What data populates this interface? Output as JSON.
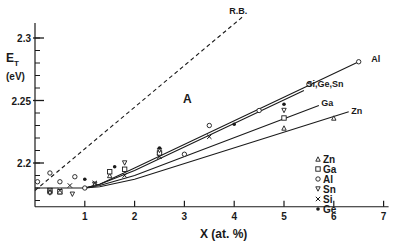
{
  "chart_data": {
    "type": "line",
    "title": "",
    "xlabel": "X (at. %)",
    "ylabel_main": "E",
    "ylabel_sub": "T",
    "ylabel_unit": "(eV)",
    "xlim": [
      0,
      7.1
    ],
    "ylim": [
      2.165,
      2.32
    ],
    "x_ticks": [
      1,
      2,
      3,
      4,
      5,
      6,
      7
    ],
    "y_ticks": [
      {
        "value": 2.2,
        "label": "2.2"
      },
      {
        "value": 2.25,
        "label": "2.25"
      },
      {
        "value": 2.3,
        "label": "2.3"
      }
    ],
    "y_minor_step": 0.01,
    "region_label": "A",
    "series": [
      {
        "name": "R.B.",
        "style": "dashed",
        "points": [
          [
            0,
            2.178
          ],
          [
            4.2,
            2.318
          ]
        ],
        "label": "R.B.",
        "label_pos": [
          3.9,
          2.322
        ]
      },
      {
        "name": "Al",
        "style": "solid",
        "points": [
          [
            0,
            2.18
          ],
          [
            1.0,
            2.18
          ],
          [
            1.3,
            2.183
          ],
          [
            2.0,
            2.196
          ],
          [
            6.5,
            2.281
          ]
        ],
        "label": "Al",
        "label_pos": [
          6.75,
          2.283
        ]
      },
      {
        "name": "Si,Ge,Sn",
        "style": "solid",
        "points": [
          [
            1.0,
            2.18
          ],
          [
            1.3,
            2.183
          ],
          [
            2.0,
            2.194
          ],
          [
            5.4,
            2.258
          ]
        ],
        "label": "Si,Ge,Sn",
        "label_pos": [
          5.45,
          2.263
        ]
      },
      {
        "name": "Ga",
        "style": "solid",
        "points": [
          [
            1.0,
            2.18
          ],
          [
            1.3,
            2.182
          ],
          [
            2.0,
            2.19
          ],
          [
            5.7,
            2.246
          ]
        ],
        "label": "Ga",
        "label_pos": [
          5.75,
          2.248
        ]
      },
      {
        "name": "Zn",
        "style": "solid",
        "points": [
          [
            1.0,
            2.18
          ],
          [
            1.3,
            2.181
          ],
          [
            2.0,
            2.187
          ],
          [
            6.3,
            2.241
          ]
        ],
        "label": "Zn",
        "label_pos": [
          6.35,
          2.242
        ]
      }
    ],
    "markers": [
      {
        "element": "Al",
        "symbol": "circle",
        "points": [
          [
            0.05,
            2.185
          ],
          [
            0.3,
            2.192
          ],
          [
            0.5,
            2.185
          ],
          [
            0.8,
            2.189
          ],
          [
            1.0,
            2.18
          ],
          [
            3.0,
            2.207
          ],
          [
            3.5,
            2.23
          ],
          [
            4.5,
            2.242
          ],
          [
            5.5,
            2.263
          ],
          [
            6.5,
            2.281
          ]
        ]
      },
      {
        "element": "Zn",
        "symbol": "triangle",
        "points": [
          [
            0.3,
            2.177
          ],
          [
            0.5,
            2.177
          ],
          [
            1.5,
            2.19
          ],
          [
            2.5,
            2.21
          ],
          [
            5.0,
            2.228
          ],
          [
            6.0,
            2.236
          ]
        ]
      },
      {
        "element": "Ga",
        "symbol": "square",
        "points": [
          [
            0.3,
            2.178
          ],
          [
            0.5,
            2.177
          ],
          [
            1.5,
            2.193
          ],
          [
            1.8,
            2.195
          ],
          [
            2.5,
            2.208
          ],
          [
            5.0,
            2.236
          ]
        ]
      },
      {
        "element": "Sn",
        "symbol": "triangle-down",
        "points": [
          [
            0.3,
            2.176
          ],
          [
            0.75,
            2.175
          ],
          [
            1.2,
            2.183
          ],
          [
            1.8,
            2.2
          ],
          [
            2.5,
            2.21
          ],
          [
            5.0,
            2.242
          ]
        ]
      },
      {
        "element": "Si",
        "symbol": "x",
        "points": [
          [
            0.3,
            2.178
          ],
          [
            0.5,
            2.178
          ],
          [
            0.7,
            2.182
          ],
          [
            1.2,
            2.184
          ],
          [
            1.8,
            2.19
          ],
          [
            2.5,
            2.205
          ],
          [
            3.5,
            2.221
          ]
        ]
      },
      {
        "element": "Ge",
        "symbol": "dot",
        "points": [
          [
            1.0,
            2.187
          ],
          [
            1.6,
            2.197
          ],
          [
            2.5,
            2.212
          ],
          [
            4.0,
            2.231
          ],
          [
            5.0,
            2.247
          ]
        ]
      }
    ],
    "legend": {
      "position": "lower-right",
      "entries": [
        {
          "symbol": "triangle",
          "label": "Zn"
        },
        {
          "symbol": "square",
          "label": "Ga"
        },
        {
          "symbol": "circle",
          "label": "Al"
        },
        {
          "symbol": "triangle-down",
          "label": "Sn"
        },
        {
          "symbol": "x",
          "label": "Si"
        },
        {
          "symbol": "dot",
          "label": "Ge"
        }
      ]
    },
    "grid": false,
    "color": "#1a1a1a"
  }
}
